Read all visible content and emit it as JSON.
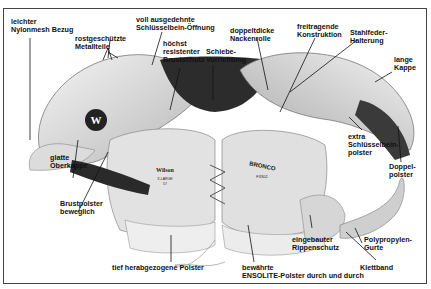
{
  "figure": {
    "brand_left_pad": "Wilson",
    "left_pad_size": "X-LARGE",
    "left_pad_sub": "57",
    "right_pad_logo": "BRONCO",
    "right_pad_model": "F3302",
    "colors": {
      "ink": "#111111",
      "pad_light": "#e8e8e8",
      "pad_mid": "#bdbdbd",
      "pad_dark": "#3a3a3a",
      "frame": "#444444"
    }
  },
  "labels": [
    {
      "id": "nylonmesh",
      "text": "leichter\nNylonmesh Bezug"
    },
    {
      "id": "metallteile",
      "text": "rostgeschützte\nMetallteile"
    },
    {
      "id": "schluesselbein-oeffnung",
      "text": "voll ausgedehnte\nSchlüsselbein-Öffnung"
    },
    {
      "id": "brustschutz",
      "text": "höchst\nresistenter\nBrustschutz"
    },
    {
      "id": "schiebe",
      "text": "Schiebe-\nVorrichtung"
    },
    {
      "id": "nackenrolle",
      "text": "doppeltdicke\nNackenrolle"
    },
    {
      "id": "freitragend",
      "text": "freitragende\nKonstruktion"
    },
    {
      "id": "stahlfeder",
      "text": "Stahlfeder-\nHalterung"
    },
    {
      "id": "lange-kappe",
      "text": "lange\nKappe"
    },
    {
      "id": "oberkappe",
      "text": "glatte\nOberkappe"
    },
    {
      "id": "extra-polster",
      "text": "extra\nSchlüsselbein-\npolster"
    },
    {
      "id": "doppelpolster",
      "text": "Doppel-\npolster"
    },
    {
      "id": "brustpolster",
      "text": "Brustpolster\nbeweglich"
    },
    {
      "id": "rippenschutz",
      "text": "eingebauter\nRippenschutz"
    },
    {
      "id": "polypropylen",
      "text": "Polypropylen-\nGurte"
    },
    {
      "id": "tief-polster",
      "text": "tief herabgezogene Polster"
    },
    {
      "id": "ensolite",
      "text": "bewährte\nENSOLITE-Polster durch und durch"
    },
    {
      "id": "klettband",
      "text": "Klettband"
    }
  ]
}
